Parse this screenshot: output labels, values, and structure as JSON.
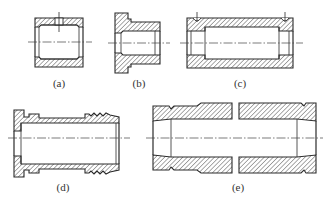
{
  "figure": {
    "colors": {
      "line": "#2b2b2b",
      "centerline": "#444444",
      "label": "#333333",
      "background": "#ffffff"
    },
    "parts": [
      {
        "id": "a",
        "label": "(a)",
        "description": "Plain cylindrical bushing with radial oil hole"
      },
      {
        "id": "b",
        "label": "(b)",
        "description": "Flanged bushing with undercut groove"
      },
      {
        "id": "c",
        "label": "(c)",
        "description": "Long bushing with stepped relieved bore and two oil holes"
      },
      {
        "id": "d",
        "label": "(d)",
        "description": "Flanged sleeve with grooved / threaded outer end"
      },
      {
        "id": "e",
        "label": "(e)",
        "description": "Long split-view sleeve with tapered ends and grooves"
      }
    ]
  }
}
